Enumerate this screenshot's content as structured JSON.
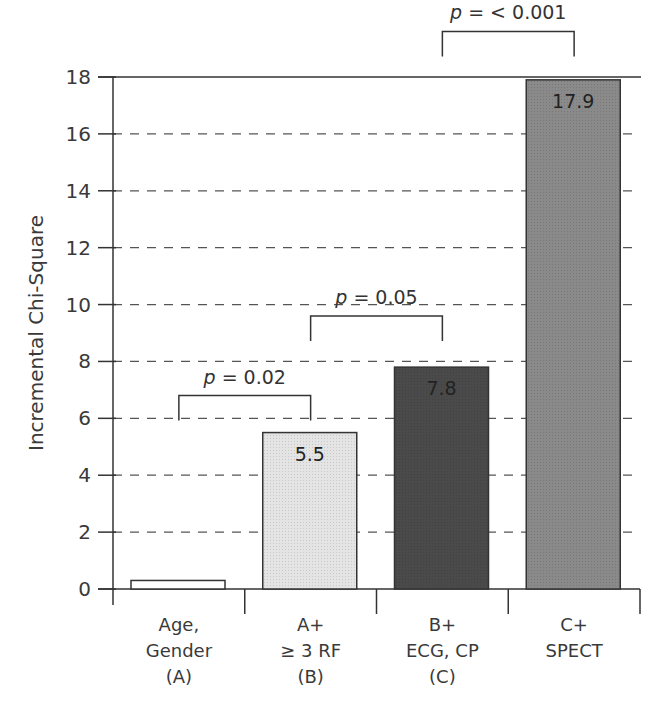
{
  "chart_data": {
    "type": "bar",
    "title": "",
    "xlabel": "",
    "ylabel": "Incremental Chi-Square",
    "ylim": [
      0,
      18
    ],
    "yticks": [
      0,
      2,
      4,
      6,
      8,
      10,
      12,
      14,
      16,
      18
    ],
    "grid": "dashed horizontal",
    "categories": [
      [
        "Age,",
        "Gender",
        "(A)"
      ],
      [
        "A+",
        "≥ 3 RF",
        "(B)"
      ],
      [
        "B+",
        "ECG, CP",
        "(C)"
      ],
      [
        "C+",
        "SPECT",
        ""
      ]
    ],
    "values": [
      0.3,
      5.5,
      7.8,
      17.9
    ],
    "value_labels": [
      "",
      "5.5",
      "7.8",
      "17.9"
    ],
    "bar_colors": [
      "#ffffff",
      "#e4e4e4",
      "#4a4a4a",
      "#8a8a8a"
    ],
    "annotations": [
      {
        "label": "p = 0.02",
        "from": 0,
        "to": 1,
        "y": 6.8
      },
      {
        "label": "p = 0.05",
        "from": 1,
        "to": 2,
        "y": 9.6
      },
      {
        "label": "p = < 0.001",
        "from": 2,
        "to": 3,
        "y": 19.6
      }
    ]
  }
}
